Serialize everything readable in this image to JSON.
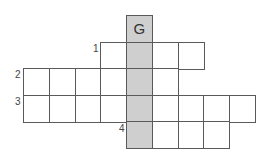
{
  "puzzle": {
    "type": "crossword",
    "hidden_word_column": 4,
    "colors": {
      "shaded": "#cfcfcf",
      "border": "#5a5a5a",
      "background": "#ffffff"
    },
    "given_letter": "G",
    "clue_numbers": {
      "one": "1",
      "two": "2",
      "three": "3",
      "four": "4"
    },
    "rows": [
      {
        "row": 0,
        "start_col": 4,
        "end_col": 4,
        "number": null
      },
      {
        "row": 1,
        "start_col": 3,
        "end_col": 7,
        "number": "1"
      },
      {
        "row": 2,
        "start_col": 0,
        "end_col": 5,
        "number": "2"
      },
      {
        "row": 3,
        "start_col": 0,
        "end_col": 9,
        "number": "3"
      },
      {
        "row": 4,
        "start_col": 4,
        "end_col": 7,
        "number": "4"
      }
    ]
  }
}
